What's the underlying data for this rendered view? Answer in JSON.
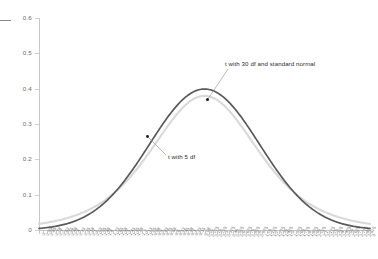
{
  "chart_data": {
    "type": "line",
    "title": "",
    "xlabel": "",
    "ylabel": "",
    "ylim": [
      0,
      0.6
    ],
    "xlim": [
      -3.0,
      3.0
    ],
    "grid": false,
    "legend_position": "inline-annotations",
    "y_ticks": [
      "0",
      "0.1",
      "0.2",
      "0.3",
      "0.4",
      "0.5",
      "0.6"
    ],
    "y_tick_values": [
      0,
      0.1,
      0.2,
      0.3,
      0.4,
      0.5,
      0.6
    ],
    "x_ticks": [
      "-3",
      "-2.93",
      "-2.85",
      "-2.78",
      "-2.7",
      "-2.63",
      "-2.55",
      "-2.48",
      "-2.4",
      "-2.33",
      "-2.25",
      "-2.18",
      "-2.1",
      "-2.03",
      "-1.95",
      "-1.88",
      "-1.8",
      "-1.73",
      "-1.65",
      "-1.58",
      "-1.5",
      "-1.43",
      "-1.35",
      "-1.28",
      "-1.2",
      "-1.13",
      "-1.05",
      "-0.98",
      "-0.9",
      "-0.83",
      "-0.75",
      "-0.68",
      "-0.6",
      "-0.53",
      "-0.45",
      "-0.38",
      "-0.3",
      "-0.23",
      "-0.15",
      "-0.08",
      "0.00",
      "0.075",
      "0.15",
      "0.225",
      "0.3",
      "0.375",
      "0.45",
      "0.525",
      "0.6",
      "0.675",
      "0.75",
      "0.825",
      "0.9",
      "0.975",
      "1.05",
      "1.125",
      "1.2",
      "1.275",
      "1.35",
      "1.425",
      "1.5",
      "1.575",
      "1.65",
      "1.725",
      "1.8",
      "1.875",
      "1.95",
      "2.025",
      "2.1",
      "2.175",
      "2.25",
      "2.325",
      "2.4",
      "2.475",
      "2.55",
      "2.625",
      "2.7",
      "2.775",
      "2.85",
      "2.925",
      "3"
    ],
    "series": [
      {
        "name": "t with 30 df and standard normal",
        "color": "#555555",
        "peak": 0.399,
        "x": [
          -3.0,
          -2.8,
          -2.6,
          -2.4,
          -2.2,
          -2.0,
          -1.8,
          -1.6,
          -1.4,
          -1.2,
          -1.0,
          -0.8,
          -0.6,
          -0.4,
          -0.2,
          0.0,
          0.2,
          0.4,
          0.6,
          0.8,
          1.0,
          1.2,
          1.4,
          1.6,
          1.8,
          2.0,
          2.2,
          2.4,
          2.6,
          2.8,
          3.0
        ],
        "values": [
          0.0044,
          0.0079,
          0.0136,
          0.0224,
          0.0355,
          0.054,
          0.079,
          0.1109,
          0.1497,
          0.1942,
          0.242,
          0.2897,
          0.3332,
          0.3683,
          0.391,
          0.3989,
          0.391,
          0.3683,
          0.3332,
          0.2897,
          0.242,
          0.1942,
          0.1497,
          0.1109,
          0.079,
          0.054,
          0.0355,
          0.0224,
          0.0136,
          0.0079,
          0.0044
        ]
      },
      {
        "name": "t with 5 df",
        "color": "#d6d6d6",
        "peak": 0.3796,
        "x": [
          -3.0,
          -2.8,
          -2.6,
          -2.4,
          -2.2,
          -2.0,
          -1.8,
          -1.6,
          -1.4,
          -1.2,
          -1.0,
          -0.8,
          -0.6,
          -0.4,
          -0.2,
          0.0,
          0.2,
          0.4,
          0.6,
          0.8,
          1.0,
          1.2,
          1.4,
          1.6,
          1.8,
          2.0,
          2.2,
          2.4,
          2.6,
          2.8,
          3.0
        ],
        "values": [
          0.0173,
          0.0217,
          0.0276,
          0.0354,
          0.0458,
          0.0598,
          0.0785,
          0.1032,
          0.1353,
          0.1755,
          0.2197,
          0.2659,
          0.3108,
          0.3497,
          0.3779,
          0.3796,
          0.3779,
          0.3497,
          0.3108,
          0.2659,
          0.2197,
          0.1755,
          0.1353,
          0.1032,
          0.0785,
          0.0598,
          0.0458,
          0.0354,
          0.0276,
          0.0217,
          0.0173
        ]
      }
    ],
    "annotations": [
      {
        "id": "normal",
        "text": "t with 30 df and standard normal"
      },
      {
        "id": "t5",
        "text": "t with 5 df"
      }
    ]
  }
}
